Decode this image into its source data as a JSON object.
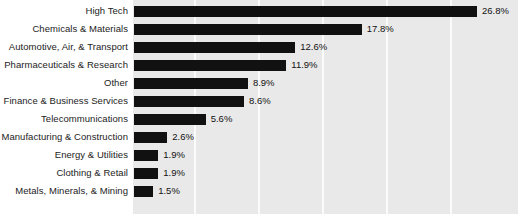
{
  "chart_data": {
    "type": "bar",
    "orientation": "horizontal",
    "title": "",
    "subtitle": "",
    "xlabel": "",
    "ylabel": "",
    "xlim": [
      0,
      30
    ],
    "grid": true,
    "gridlines_at": [
      5,
      10,
      15,
      20,
      25
    ],
    "legend": "none",
    "bar_color": "#111111",
    "plot_background": "#e9e9e9",
    "gridline_color": "#fbfbfb",
    "value_suffix": "%",
    "categories": [
      "High Tech",
      "Chemicals & Materials",
      "Automotive, Air, & Transport",
      "Pharmaceuticals & Research",
      "Other",
      "Finance & Business Services",
      "Telecommunications",
      "Manufacturing & Construction",
      "Energy & Utilities",
      "Clothing & Retail",
      "Metals, Minerals, & Mining"
    ],
    "values": [
      26.8,
      17.8,
      12.6,
      11.9,
      8.9,
      8.6,
      5.6,
      2.6,
      1.9,
      1.9,
      1.5
    ],
    "data_labels": [
      "26.8%",
      "17.8%",
      "12.6%",
      "11.9%",
      "8.9%",
      "8.6%",
      "5.6%",
      "2.6%",
      "1.9%",
      "1.9%",
      "1.5%"
    ]
  }
}
